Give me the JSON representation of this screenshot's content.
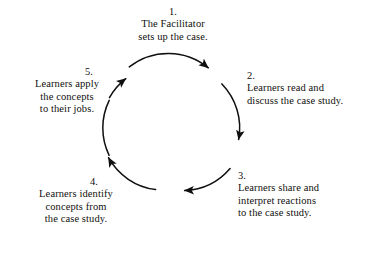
{
  "diagram": {
    "type": "cycle",
    "title": "",
    "background_color": "#ffffff",
    "stroke_color": "#100f0d",
    "center": {
      "x": 172,
      "y": 128
    },
    "radius": 63,
    "direction": "clockwise",
    "steps": [
      {
        "number": "1.",
        "lines": [
          "The Facilitator",
          "sets up the case."
        ],
        "position": "top"
      },
      {
        "number": "2.",
        "lines": [
          "Learners read and",
          "discuss the case study."
        ],
        "position": "upper-right"
      },
      {
        "number": "3.",
        "lines": [
          "Learners share and",
          "interpret reactions",
          "to the case study."
        ],
        "position": "lower-right"
      },
      {
        "number": "4.",
        "lines": [
          "Learners identify",
          "concepts from",
          "the case study."
        ],
        "position": "lower-left"
      },
      {
        "number": "5.",
        "lines": [
          "Learners apply",
          "the concepts",
          "to their jobs."
        ],
        "position": "upper-left"
      }
    ],
    "arrows": [
      {
        "name": "arrow-1-to-2",
        "from": "1",
        "to": "2",
        "head_at": {
          "x": 212,
          "y": 66
        }
      },
      {
        "name": "arrow-2-to-3",
        "from": "2",
        "to": "3",
        "head_at": {
          "x": 239,
          "y": 146
        }
      },
      {
        "name": "arrow-3-to-4",
        "from": "3",
        "to": "4",
        "head_at": {
          "x": 178,
          "y": 203
        }
      },
      {
        "name": "arrow-4-to-5",
        "from": "4",
        "to": "5",
        "head_at": {
          "x": 104,
          "y": 152
        }
      },
      {
        "name": "arrow-5-to-1",
        "from": "5",
        "to": "1",
        "head_at": {
          "x": 121,
          "y": 70
        }
      }
    ]
  }
}
